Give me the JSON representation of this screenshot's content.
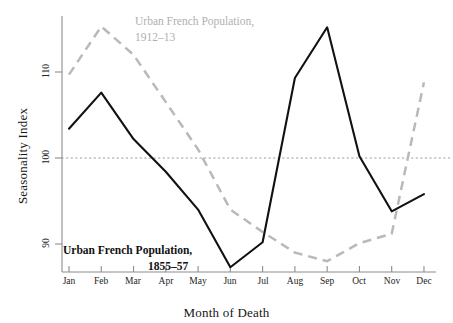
{
  "chart_data": {
    "type": "line",
    "title": "",
    "xlabel": "Month of Death",
    "ylabel": "Seasonality Index",
    "categories": [
      "Jan",
      "Feb",
      "Mar",
      "Apr",
      "May",
      "Jun",
      "Jul",
      "Aug",
      "Sep",
      "Oct",
      "Nov",
      "Dec"
    ],
    "yticks": [
      90,
      100,
      110
    ],
    "ylim": [
      85.5,
      116.5
    ],
    "grid": false,
    "reference_line": {
      "value": 100,
      "style": "dotted",
      "color": "#9a9a9a"
    },
    "legend_position": "inline-annotations",
    "series": [
      {
        "name": "Urban French Population, 1855–57",
        "style": "solid",
        "color": "#111111",
        "values": [
          103.4,
          107.6,
          102.2,
          98.4,
          94.0,
          87.3,
          90.2,
          109.3,
          115.2,
          100.2,
          93.8,
          95.8
        ]
      },
      {
        "name": "Urban French Population, 1912–13",
        "style": "dashed",
        "color": "#b9b9b9",
        "values": [
          109.7,
          115.3,
          112.0,
          106.5,
          101.0,
          94.0,
          91.4,
          89.0,
          88.0,
          90.1,
          91.2,
          108.8
        ]
      }
    ]
  },
  "annotations": {
    "series_1912_label_line1": "Urban French Population,",
    "series_1912_label_line2": "1912–13",
    "series_1855_label_line1": "Urban French Population,",
    "series_1855_label_line2": "1855–57"
  },
  "axes": {
    "x_title": "Month of Death",
    "y_title": "Seasonality Index"
  },
  "colors": {
    "series_1855": "#111111",
    "series_1912": "#b9b9b9",
    "axis": "#7d7d7d",
    "reference": "#9a9a9a",
    "background": "#ffffff"
  }
}
